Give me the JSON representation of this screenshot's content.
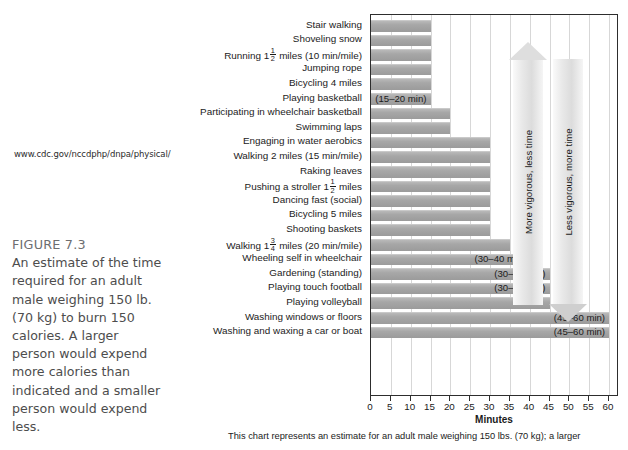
{
  "source_url": "www.cdc.gov/nccdphp/dnpa/physical/",
  "caption": {
    "title": "FIGURE 7.3",
    "text": "An estimate of the time required for an adult male weighing 150 lb. (70 kg) to burn 150 calories. A larger person would expend more calories than indicated and a smaller person would expend less."
  },
  "bottom_note": "This chart represents an estimate for an adult male weighing 150 lbs. (70 kg); a larger",
  "annotations": {
    "arrow_up": "More vigorous, less time",
    "arrow_down": "Less vigorous, more time",
    "runner_icon": "running-person-icon"
  },
  "chart_data": {
    "type": "bar",
    "orientation": "horizontal",
    "title": "",
    "xlabel": "Minutes",
    "ylabel": "",
    "xlim": [
      0,
      62
    ],
    "xticks": [
      0,
      5,
      10,
      15,
      20,
      25,
      30,
      35,
      40,
      45,
      50,
      55,
      60
    ],
    "grid": true,
    "grid_axis": "x",
    "legend": "none",
    "bar_color": "#a8a8a8",
    "categories": [
      "Stair walking",
      "Shoveling snow",
      "Running 1½ miles (10 min/mile)",
      "Jumping rope",
      "Bicycling 4 miles",
      "Playing basketball",
      "Participating in wheelchair basketball",
      "Swimming laps",
      "Engaging in water aerobics",
      "Walking 2 miles (15 min/mile)",
      "Raking leaves",
      "Pushing a stroller 1½ miles",
      "Dancing fast (social)",
      "Bicycling 5 miles",
      "Shooting baskets",
      "Walking 1¾ miles (20 min/mile)",
      "Wheeling self in wheelchair",
      "Gardening (standing)",
      "Playing touch football",
      "Playing volleyball",
      "Washing windows or floors",
      "Washing and waxing a car or boat"
    ],
    "values": [
      15,
      15,
      15,
      15,
      15,
      15,
      20,
      20,
      30,
      30,
      30,
      30,
      30,
      30,
      30,
      35,
      40,
      45,
      45,
      45,
      60,
      60
    ],
    "data_labels": [
      "",
      "",
      "",
      "",
      "",
      "(15–20 min)",
      "",
      "",
      "",
      "",
      "",
      "",
      "",
      "",
      "",
      "",
      "(30–40 min)",
      "(30–45 min)",
      "(30–45 min)",
      "",
      "(45–60 min)",
      "(45–60 min)"
    ]
  },
  "label_parts": {
    "running": [
      "Running 1",
      "1",
      "2",
      " miles (10 min/mile)"
    ],
    "stroller": [
      "Pushing a stroller 1",
      "1",
      "2",
      " miles"
    ],
    "walking175": [
      "Walking 1",
      "3",
      "4",
      " miles (20 min/mile)"
    ]
  }
}
